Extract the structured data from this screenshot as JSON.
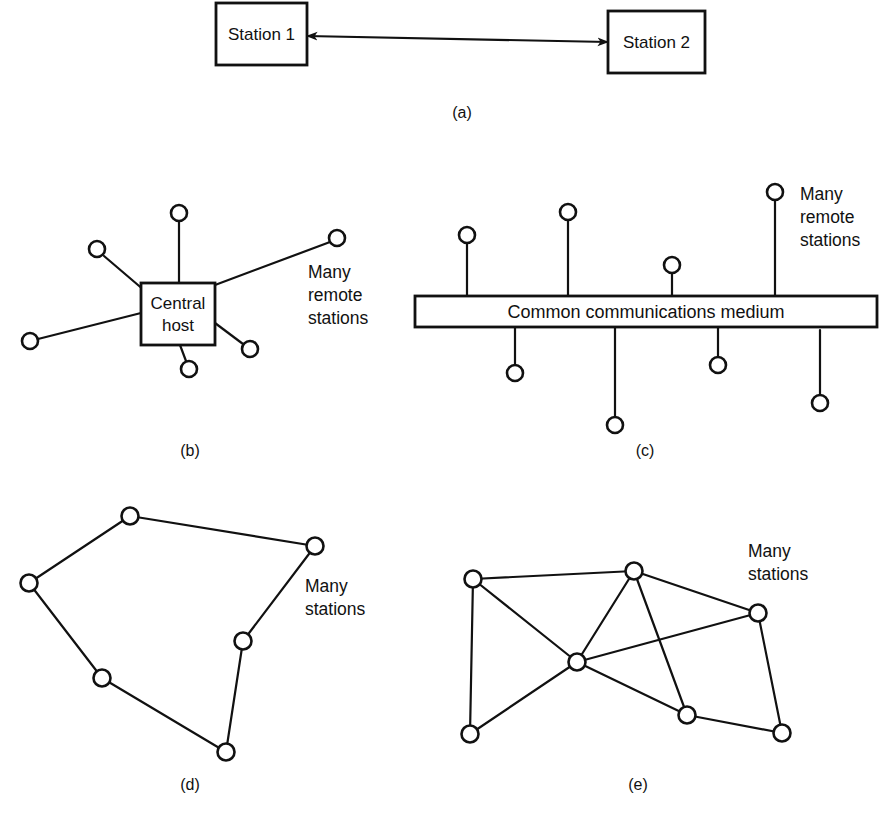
{
  "figure": {
    "width": 888,
    "height": 821,
    "background": "#ffffff",
    "ink_color": "#111111"
  },
  "panels": [
    {
      "id": "a",
      "caption": "(a)",
      "caption_pos": {
        "x": 462,
        "y": 118
      },
      "type": "point-to-point",
      "boxes": [
        {
          "name": "station-1",
          "label": "Station 1",
          "x": 216,
          "y": 3,
          "w": 91,
          "h": 62
        },
        {
          "name": "station-2",
          "label": "Station 2",
          "x": 608,
          "y": 11,
          "w": 97,
          "h": 62
        }
      ],
      "link": {
        "x1": 307,
        "y1": 36,
        "x2": 608,
        "y2": 42,
        "arrow_start": true,
        "arrow_end": true
      }
    },
    {
      "id": "b",
      "caption": "(b)",
      "caption_pos": {
        "x": 190,
        "y": 456
      },
      "type": "star",
      "hub": {
        "name": "central-host",
        "label_line1": "Central",
        "label_line2": "host",
        "x": 141,
        "y": 283,
        "w": 74,
        "h": 62
      },
      "annotation": {
        "lines": [
          "Many",
          "remote",
          "stations"
        ],
        "x": 308,
        "y": 278
      },
      "stations": [
        {
          "x": 179,
          "y": 213,
          "anchor_x": 179,
          "anchor_y": 283
        },
        {
          "x": 97,
          "y": 249,
          "anchor_x": 141,
          "anchor_y": 290
        },
        {
          "x": 30,
          "y": 341,
          "anchor_x": 141,
          "anchor_y": 313
        },
        {
          "x": 189,
          "y": 369,
          "anchor_x": 180,
          "anchor_y": 345
        },
        {
          "x": 250,
          "y": 349,
          "anchor_x": 215,
          "anchor_y": 323
        },
        {
          "x": 337,
          "y": 238,
          "anchor_x": 215,
          "anchor_y": 285
        }
      ]
    },
    {
      "id": "c",
      "caption": "(c)",
      "caption_pos": {
        "x": 645,
        "y": 456
      },
      "type": "bus",
      "bus": {
        "name": "common-medium",
        "label": "Common communications medium",
        "x": 415,
        "y": 296,
        "w": 462,
        "h": 31
      },
      "annotation": {
        "lines": [
          "Many",
          "remote",
          "stations"
        ],
        "x": 800,
        "y": 186
      },
      "stations_top": [
        {
          "x": 467,
          "y": 235
        },
        {
          "x": 568,
          "y": 212
        },
        {
          "x": 672,
          "y": 265
        },
        {
          "x": 775,
          "y": 192
        }
      ],
      "stations_bottom": [
        {
          "x": 515,
          "y": 373
        },
        {
          "x": 615,
          "y": 425
        },
        {
          "x": 718,
          "y": 365
        },
        {
          "x": 820,
          "y": 403
        }
      ]
    },
    {
      "id": "d",
      "caption": "(d)",
      "caption_pos": {
        "x": 190,
        "y": 790
      },
      "type": "ring",
      "annotation": {
        "lines": [
          "Many",
          "stations"
        ],
        "x": 305,
        "y": 578
      },
      "nodes": [
        {
          "x": 130,
          "y": 516
        },
        {
          "x": 315,
          "y": 546
        },
        {
          "x": 243,
          "y": 641
        },
        {
          "x": 226,
          "y": 752
        },
        {
          "x": 102,
          "y": 678
        },
        {
          "x": 29,
          "y": 583
        }
      ],
      "edges": [
        [
          0,
          1
        ],
        [
          1,
          2
        ],
        [
          2,
          3
        ],
        [
          3,
          4
        ],
        [
          4,
          5
        ],
        [
          5,
          0
        ]
      ]
    },
    {
      "id": "e",
      "caption": "(e)",
      "caption_pos": {
        "x": 638,
        "y": 790
      },
      "type": "mesh",
      "annotation": {
        "lines": [
          "Many",
          "stations"
        ],
        "x": 748,
        "y": 543
      },
      "nodes": [
        {
          "x": 473,
          "y": 579
        },
        {
          "x": 634,
          "y": 571
        },
        {
          "x": 758,
          "y": 613
        },
        {
          "x": 577,
          "y": 662
        },
        {
          "x": 687,
          "y": 715
        },
        {
          "x": 782,
          "y": 733
        },
        {
          "x": 470,
          "y": 734
        }
      ],
      "edges": [
        [
          0,
          1
        ],
        [
          0,
          3
        ],
        [
          0,
          6
        ],
        [
          1,
          2
        ],
        [
          1,
          3
        ],
        [
          1,
          4
        ],
        [
          2,
          3
        ],
        [
          2,
          5
        ],
        [
          3,
          4
        ],
        [
          3,
          6
        ],
        [
          4,
          5
        ]
      ]
    }
  ]
}
